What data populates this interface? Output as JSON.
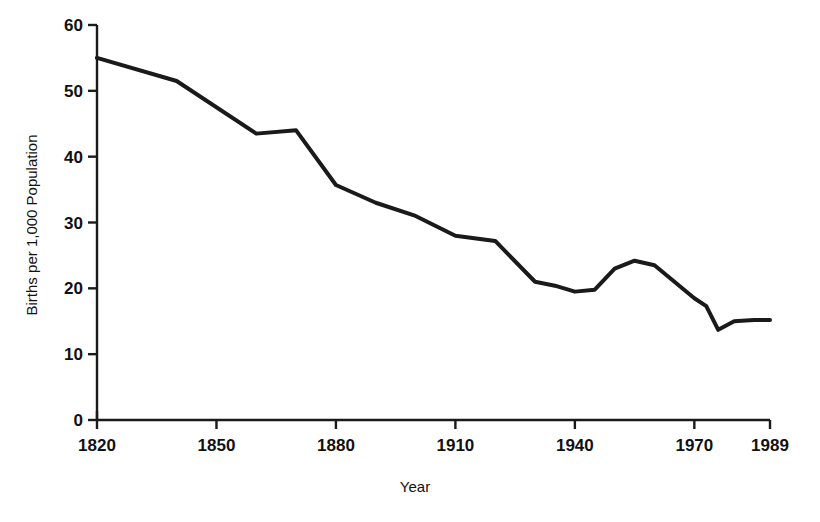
{
  "chart_data": {
    "type": "line",
    "title": "",
    "xlabel": "Year",
    "ylabel": "Births per 1,000 Population",
    "xlim": [
      1820,
      1989
    ],
    "ylim": [
      0,
      60
    ],
    "xticks": [
      1820,
      1850,
      1880,
      1910,
      1940,
      1970,
      1989
    ],
    "xtick_labels": [
      "1820",
      "1850",
      "1880",
      "1910",
      "1940",
      "1970",
      "1989"
    ],
    "yticks": [
      0,
      10,
      20,
      30,
      40,
      50,
      60
    ],
    "ytick_labels": [
      "0",
      "10",
      "20",
      "30",
      "40",
      "50",
      "60"
    ],
    "grid": false,
    "legend": false,
    "line_color": "#1a1a1a",
    "line_width": 4,
    "axis_color": "#1a1a1a",
    "background": "#ffffff",
    "series": [
      {
        "name": "Birth rate",
        "x": [
          1820,
          1840,
          1860,
          1870,
          1880,
          1890,
          1900,
          1910,
          1920,
          1930,
          1935,
          1940,
          1945,
          1950,
          1955,
          1960,
          1965,
          1970,
          1973,
          1976,
          1980,
          1985,
          1989
        ],
        "values": [
          55.0,
          51.5,
          43.5,
          44.0,
          35.7,
          33.0,
          31.0,
          28.0,
          27.2,
          21.0,
          20.4,
          19.5,
          19.8,
          23.0,
          24.2,
          23.5,
          21.0,
          18.5,
          17.3,
          13.7,
          15.0,
          15.2,
          15.2
        ]
      }
    ]
  },
  "figure": {
    "plot_area": {
      "left": 97,
      "right": 770,
      "top": 25,
      "bottom": 420
    }
  }
}
